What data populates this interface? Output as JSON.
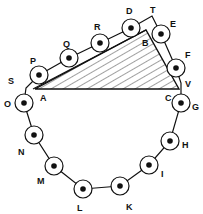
{
  "diagram": {
    "title": "",
    "nodes": [
      {
        "id": "P",
        "label": "P",
        "x": 39,
        "y": 75,
        "lx": 30,
        "ly": 64
      },
      {
        "id": "Q",
        "label": "Q",
        "x": 69,
        "y": 58,
        "lx": 63,
        "ly": 47
      },
      {
        "id": "R",
        "label": "R",
        "x": 100,
        "y": 43,
        "lx": 94,
        "ly": 30
      },
      {
        "id": "D",
        "label": "D",
        "x": 131,
        "y": 28,
        "lx": 126,
        "ly": 14
      },
      {
        "id": "E",
        "label": "E",
        "x": 161,
        "y": 34,
        "lx": 170,
        "ly": 27
      },
      {
        "id": "F",
        "label": "F",
        "x": 176,
        "y": 68,
        "lx": 185,
        "ly": 58
      },
      {
        "id": "G",
        "label": "G",
        "x": 181,
        "y": 103,
        "lx": 192,
        "ly": 110
      },
      {
        "id": "H",
        "label": "H",
        "x": 170,
        "y": 141,
        "lx": 182,
        "ly": 148
      },
      {
        "id": "I",
        "label": "I",
        "x": 149,
        "y": 165,
        "lx": 161,
        "ly": 177
      },
      {
        "id": "K",
        "label": "K",
        "x": 120,
        "y": 186,
        "lx": 126,
        "ly": 210
      },
      {
        "id": "L",
        "label": "L",
        "x": 83,
        "y": 189,
        "lx": 77,
        "ly": 211
      },
      {
        "id": "M",
        "label": "M",
        "x": 54,
        "y": 166,
        "lx": 37,
        "ly": 184
      },
      {
        "id": "N",
        "label": "N",
        "x": 34,
        "y": 135,
        "lx": 18,
        "ly": 155
      },
      {
        "id": "O",
        "label": "O",
        "x": 24,
        "y": 103,
        "lx": 4,
        "ly": 107
      }
    ],
    "belt_points": [
      [
        24,
        103
      ],
      [
        26,
        88
      ],
      [
        39,
        75
      ],
      [
        69,
        58
      ],
      [
        100,
        43
      ],
      [
        131,
        28
      ],
      [
        152,
        16
      ],
      [
        161,
        34
      ],
      [
        176,
        68
      ],
      [
        181,
        83
      ],
      [
        181,
        103
      ],
      [
        170,
        141
      ],
      [
        149,
        165
      ],
      [
        120,
        186
      ],
      [
        83,
        189
      ],
      [
        54,
        166
      ],
      [
        34,
        135
      ],
      [
        24,
        103
      ]
    ],
    "belt_inner_line": [
      [
        33,
        89
      ],
      [
        146,
        30
      ]
    ],
    "point_labels": [
      {
        "id": "S",
        "label": "S",
        "x": 8,
        "y": 84
      },
      {
        "id": "T",
        "label": "T",
        "x": 150,
        "y": 13
      },
      {
        "id": "V",
        "label": "V",
        "x": 185,
        "y": 87
      },
      {
        "id": "A",
        "label": "A",
        "x": 40,
        "y": 101
      },
      {
        "id": "B",
        "label": "B",
        "x": 142,
        "y": 46
      },
      {
        "id": "C",
        "label": "C",
        "x": 165,
        "y": 101
      }
    ],
    "triangle": {
      "A": [
        35,
        89
      ],
      "B": [
        146,
        30
      ],
      "C": [
        179,
        89
      ],
      "fill": "hatched"
    },
    "node_radius": 9,
    "dot_radius": 2.8,
    "colors": {
      "stroke": "#111111",
      "background": "#ffffff"
    }
  }
}
